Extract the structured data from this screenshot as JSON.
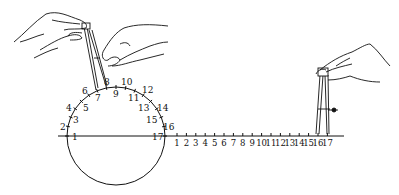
{
  "diagram": {
    "circle": {
      "cx": 116,
      "cy": 136,
      "r": 49,
      "labels_outer": [
        {
          "text": "2",
          "x": 60,
          "y": 130
        },
        {
          "text": "4",
          "x": 66,
          "y": 111
        },
        {
          "text": "6",
          "x": 82,
          "y": 94
        },
        {
          "text": "8",
          "x": 104,
          "y": 85
        },
        {
          "text": "10",
          "x": 121,
          "y": 85
        },
        {
          "text": "12",
          "x": 142,
          "y": 93
        },
        {
          "text": "14",
          "x": 157,
          "y": 111
        },
        {
          "text": "16",
          "x": 163,
          "y": 130
        }
      ],
      "labels_inner": [
        {
          "text": "1",
          "x": 72,
          "y": 140
        },
        {
          "text": "3",
          "x": 73,
          "y": 123
        },
        {
          "text": "5",
          "x": 83,
          "y": 111
        },
        {
          "text": "7",
          "x": 95,
          "y": 101
        },
        {
          "text": "9",
          "x": 113,
          "y": 97
        },
        {
          "text": "11",
          "x": 128,
          "y": 101
        },
        {
          "text": "13",
          "x": 138,
          "y": 111
        },
        {
          "text": "15",
          "x": 146,
          "y": 123
        },
        {
          "text": "17",
          "x": 152,
          "y": 140
        }
      ]
    },
    "line": {
      "y": 136,
      "x_start": 58,
      "x_end": 344,
      "labels": [
        "1",
        "2",
        "3",
        "4",
        "5",
        "6",
        "7",
        "8",
        "9",
        "10",
        "11",
        "12",
        "13",
        "14",
        "15",
        "16",
        "17"
      ],
      "label_x_start": 177,
      "label_spacing": 9.4
    }
  }
}
